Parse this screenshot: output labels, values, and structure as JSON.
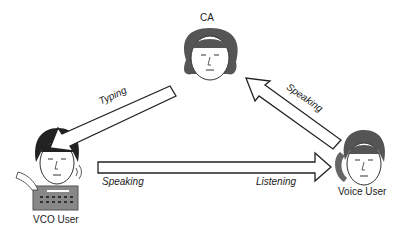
{
  "nodes": {
    "ca": {
      "label": "CA"
    },
    "vco_user": {
      "label": "VCO User"
    },
    "voice_user": {
      "label": "Voice User"
    }
  },
  "edges": {
    "ca_to_vco": {
      "label": "Typing"
    },
    "voice_to_ca": {
      "label": "Speaking"
    },
    "vco_to_voice": {
      "from_label": "Speaking",
      "to_label": "Listening"
    }
  }
}
